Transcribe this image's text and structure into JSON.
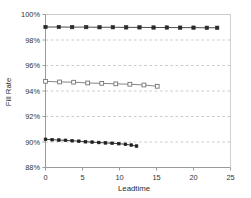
{
  "chart_data": {
    "type": "line",
    "title": "",
    "xlabel": "Leadtime",
    "ylabel": "Fill Rate",
    "xlim": [
      0,
      25
    ],
    "ylim": [
      88,
      100
    ],
    "grid": true,
    "grid_axis": "y",
    "legend": "none",
    "x_ticks": [
      0,
      5,
      10,
      15,
      20,
      25
    ],
    "x_tick_labels": [
      "0",
      "5",
      "10",
      "15",
      "20",
      "25"
    ],
    "y_ticks": [
      88,
      90,
      92,
      94,
      96,
      98,
      100
    ],
    "y_tick_labels": [
      "88%",
      "90%",
      "92%",
      "94%",
      "96%",
      "98%",
      "100%"
    ],
    "series": [
      {
        "name": "series-top",
        "marker": "filled-square",
        "color": "#2a2a2a",
        "points": [
          {
            "x": 0.0,
            "y": 99.02
          },
          {
            "x": 1.8,
            "y": 99.02
          },
          {
            "x": 3.6,
            "y": 99.01
          },
          {
            "x": 5.5,
            "y": 99.01
          },
          {
            "x": 7.3,
            "y": 99.0
          },
          {
            "x": 9.1,
            "y": 99.0
          },
          {
            "x": 10.9,
            "y": 98.99
          },
          {
            "x": 12.7,
            "y": 98.99
          },
          {
            "x": 14.6,
            "y": 98.98
          },
          {
            "x": 16.4,
            "y": 98.98
          },
          {
            "x": 18.2,
            "y": 98.97
          },
          {
            "x": 20.0,
            "y": 98.97
          },
          {
            "x": 21.8,
            "y": 98.96
          },
          {
            "x": 23.2,
            "y": 98.96
          }
        ]
      },
      {
        "name": "series-middle",
        "marker": "open-square",
        "color": "#6e6e6e",
        "points": [
          {
            "x": 0.0,
            "y": 94.76
          },
          {
            "x": 1.9,
            "y": 94.71
          },
          {
            "x": 3.8,
            "y": 94.69
          },
          {
            "x": 5.7,
            "y": 94.63
          },
          {
            "x": 7.6,
            "y": 94.6
          },
          {
            "x": 9.5,
            "y": 94.56
          },
          {
            "x": 11.4,
            "y": 94.53
          },
          {
            "x": 13.3,
            "y": 94.47
          },
          {
            "x": 15.1,
            "y": 94.37
          }
        ]
      },
      {
        "name": "series-bottom",
        "marker": "filled-square-small",
        "color": "#1f1f1f",
        "points": [
          {
            "x": 0.0,
            "y": 90.21
          },
          {
            "x": 0.9,
            "y": 90.18
          },
          {
            "x": 1.8,
            "y": 90.15
          },
          {
            "x": 2.7,
            "y": 90.13
          },
          {
            "x": 3.6,
            "y": 90.1
          },
          {
            "x": 4.5,
            "y": 90.06
          },
          {
            "x": 5.4,
            "y": 90.02
          },
          {
            "x": 6.3,
            "y": 89.99
          },
          {
            "x": 7.2,
            "y": 89.96
          },
          {
            "x": 8.1,
            "y": 89.93
          },
          {
            "x": 9.0,
            "y": 89.9
          },
          {
            "x": 9.9,
            "y": 89.87
          },
          {
            "x": 10.8,
            "y": 89.82
          },
          {
            "x": 11.6,
            "y": 89.76
          },
          {
            "x": 12.3,
            "y": 89.68
          }
        ]
      }
    ]
  },
  "colors": {
    "axis": "#9a9a9a",
    "grid": "#bdbdbd",
    "text": "#333333",
    "background": "#ffffff"
  }
}
